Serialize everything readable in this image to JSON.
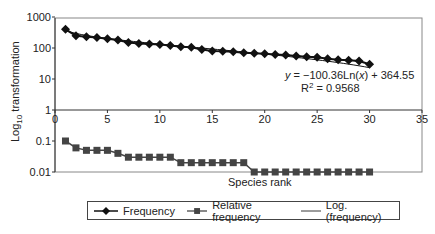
{
  "chart_data": {
    "type": "line",
    "title": "",
    "xlabel": "Species rank",
    "ylabel": "Log10 transformation",
    "y_scale": "log",
    "xlim": [
      0,
      35
    ],
    "ylim": [
      0.01,
      1000
    ],
    "x_ticks": [
      "0",
      "5",
      "10",
      "15",
      "20",
      "25",
      "30",
      "35"
    ],
    "y_ticks": [
      "1000",
      "100",
      "10",
      "1",
      "0.1",
      "0.01"
    ],
    "grid": false,
    "legend_position": "bottom",
    "x": [
      1,
      2,
      3,
      4,
      5,
      6,
      7,
      8,
      9,
      10,
      11,
      12,
      13,
      14,
      15,
      16,
      17,
      18,
      19,
      20,
      21,
      22,
      23,
      24,
      25,
      26,
      27,
      28,
      29,
      30
    ],
    "series": [
      {
        "name": "Frequency",
        "marker": "diamond",
        "values": [
          400,
          250,
          230,
          220,
          200,
          180,
          150,
          140,
          135,
          130,
          120,
          110,
          105,
          90,
          80,
          78,
          75,
          70,
          68,
          65,
          62,
          60,
          55,
          52,
          50,
          45,
          42,
          40,
          38,
          30
        ]
      },
      {
        "name": "Relative frequency",
        "marker": "square",
        "values": [
          0.1,
          0.06,
          0.05,
          0.05,
          0.05,
          0.04,
          0.03,
          0.03,
          0.03,
          0.03,
          0.03,
          0.02,
          0.02,
          0.02,
          0.02,
          0.02,
          0.02,
          0.02,
          0.01,
          0.01,
          0.01,
          0.01,
          0.01,
          0.01,
          0.01,
          0.01,
          0.01,
          0.01,
          0.01,
          0.01
        ]
      },
      {
        "name": "Log. (frequency)",
        "type": "trendline",
        "equation": "y = -100.36Ln(x) + 364.55",
        "r_squared": "R² = 0.9568"
      }
    ],
    "annotations": [
      "y = −100.36Ln(x) + 364.55",
      "R2 = 0.9568"
    ]
  },
  "labels": {
    "ylabel_main": "Log",
    "ylabel_sub": "10",
    "ylabel_rest": " transformation",
    "xlabel": "Species rank",
    "eq_y": "y",
    "eq_mid": " = −100.36Ln(",
    "eq_x": "x",
    "eq_end": ") + 364.55",
    "r2_pre": "R",
    "r2_sup": "2",
    "r2_post": " = 0.9568"
  },
  "legend": {
    "items": [
      {
        "label": "Frequency"
      },
      {
        "label": "Relative frequency"
      },
      {
        "label": "Log. (frequency)"
      }
    ]
  },
  "colors": {
    "frequency": "#111111",
    "relative": "#444444",
    "axis": "#555555"
  }
}
